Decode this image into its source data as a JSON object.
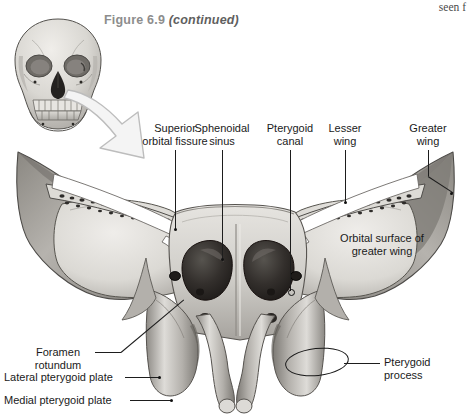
{
  "figure": {
    "caption_main": "Figure 6.9",
    "caption_continued": "(continued)",
    "column_bleed_text": "seen f"
  },
  "orientation_inset": {
    "name": "anterior-skull-orientation-diagram",
    "pointer": "hollow-arrow-pointing-down-right"
  },
  "labels": {
    "superior_orbital_fissure": {
      "line1": "Superior",
      "line2": "orbital fissure"
    },
    "sphenoidal_sinus": {
      "line1": "Sphenoidal",
      "line2": "sinus"
    },
    "pterygoid_canal": {
      "line1": "Pterygoid",
      "line2": "canal"
    },
    "lesser_wing": {
      "line1": "Lesser",
      "line2": "wing"
    },
    "greater_wing": {
      "line1": "Greater",
      "line2": "wing"
    },
    "orbital_surface": {
      "line1": "Orbital surface of",
      "line2": "greater wing"
    },
    "foramen_rotundum": {
      "line1": "Foramen",
      "line2": "rotundum"
    },
    "lateral_pterygoid_plate": {
      "line1": "Lateral pterygoid plate"
    },
    "medial_pterygoid_plate": {
      "line1": "Medial pterygoid plate"
    },
    "pterygoid_process": {
      "line1": "Pterygoid",
      "line2": "process"
    }
  },
  "colors": {
    "caption_gray": "#8d8d8d",
    "label_black": "#1a1a1a",
    "bone_light": "#e2e0dc",
    "bone_mid": "#c8c6c1",
    "bone_shadow": "#9a9791",
    "bone_dark": "#76736e",
    "sinus_dark": "#2c2c2c",
    "outline": "#3a3a38",
    "leader": "#1d1d1d",
    "arrow_fill": "#f2f2f2",
    "arrow_stroke": "#b4b4b4"
  }
}
